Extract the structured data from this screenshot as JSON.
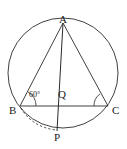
{
  "figure": {
    "kind": "circle-geometry-diagram",
    "stroke_color": "#2b2b2b",
    "label_color": "#1a1a1a",
    "background_color": "#ffffff",
    "labels": {
      "a": "A",
      "b": "B",
      "c": "C",
      "p": "P",
      "q": "Q",
      "angle_b": "60°"
    },
    "points": {
      "a": {
        "x": 63,
        "y": 22
      },
      "b": {
        "x": 20,
        "y": 106
      },
      "c": {
        "x": 108,
        "y": 106
      },
      "p": {
        "x": 57,
        "y": 131
      },
      "q": {
        "x": 60,
        "y": 104
      }
    },
    "circle": {
      "cx": 63,
      "cy": 73,
      "r": 55
    },
    "segments": [
      {
        "name": "chord-ab",
        "from": "a",
        "to": "b",
        "style": "solid"
      },
      {
        "name": "chord-ac",
        "from": "a",
        "to": "c",
        "style": "solid"
      },
      {
        "name": "chord-ap",
        "from": "a",
        "to": "p",
        "style": "solid"
      },
      {
        "name": "chord-bc",
        "from": "b",
        "to": "c",
        "style": "solid"
      },
      {
        "name": "arc-bp",
        "from": "b",
        "to": "p",
        "style": "dashed"
      }
    ],
    "angle_marks": [
      {
        "name": "angle-at-b",
        "vertex": "b",
        "label": "60°"
      },
      {
        "name": "angle-at-c",
        "vertex": "c",
        "label": ""
      }
    ]
  }
}
